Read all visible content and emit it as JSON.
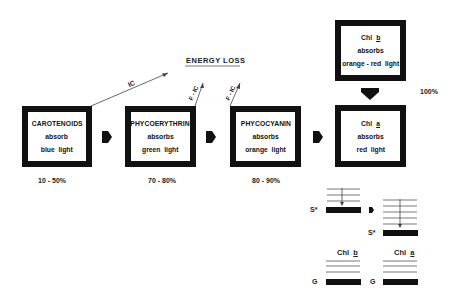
{
  "energy_loss_label": "ENERGY LOSS",
  "ic_label": "IC",
  "fic_label": "F - IC",
  "boxes": [
    {
      "name": "CAROTENOIDS",
      "verb": "absorb",
      "light": "blue  light",
      "efficiency": "10 - 50%"
    },
    {
      "name": "PHYCOERYTHRIN",
      "verb": "absorbs",
      "light": "green  light",
      "efficiency": "70 - 80%"
    },
    {
      "name": "PHYCOCYANIN",
      "verb": "absorbs",
      "light": "orange  light",
      "efficiency": "80 - 90%"
    },
    {
      "name_prefix": "Chl",
      "name_suffix": "b",
      "verb": "absorbs",
      "light": "orange - red  light"
    },
    {
      "name_prefix": "Chl",
      "name_suffix": "a",
      "verb": "absorbs",
      "light": "red  light",
      "efficiency": "100%"
    }
  ],
  "energy_levels": {
    "excited_label": "S*",
    "ground_label": "G",
    "chl_b_label_prefix": "Chl",
    "chl_b_label_suffix": "b",
    "chl_a_label_prefix": "Chl",
    "chl_a_label_suffix": "a"
  }
}
